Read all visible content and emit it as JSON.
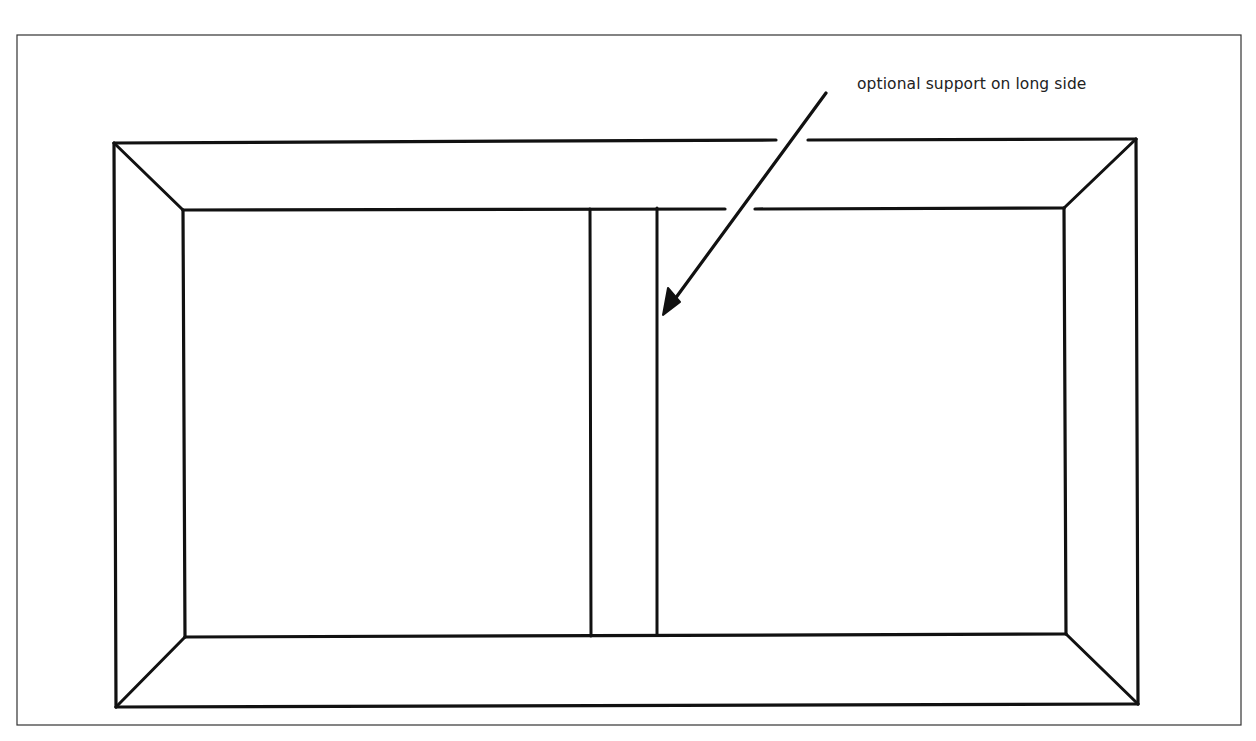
{
  "diagram": {
    "title": "",
    "annotation": {
      "text": "optional support on long side"
    },
    "colors": {
      "line": "#111111",
      "frame": "#333333",
      "background": "#ffffff"
    },
    "elements": {
      "outer_frame": {
        "x": 17,
        "y": 35,
        "w": 1224,
        "h": 690
      },
      "outer_box": {
        "tl": [
          114,
          143
        ],
        "tr": [
          1136,
          139
        ],
        "br": [
          1138,
          704
        ],
        "bl": [
          116,
          707
        ]
      },
      "inner_box": {
        "tl": [
          183,
          210
        ],
        "tr": [
          1064,
          208
        ],
        "br": [
          1066,
          634
        ],
        "bl": [
          185,
          637
        ]
      },
      "support": {
        "left_x": 590,
        "right_x": 657,
        "top_y": 209,
        "bottom_y": 636
      },
      "arrow": {
        "from": [
          826,
          93
        ],
        "to": [
          664,
          314
        ]
      }
    }
  }
}
